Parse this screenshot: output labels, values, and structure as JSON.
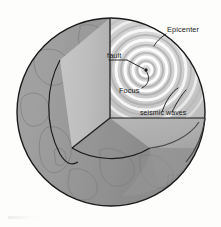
{
  "figure": {
    "type": "cutaway-sphere-diagram",
    "background_color": "#fdfdfc"
  },
  "labels": {
    "epicenter": "Epicenter",
    "fault": "fault",
    "focus": "Focus",
    "seismic_waves": "seismic waves"
  },
  "colors": {
    "outline": "#1b1b1b",
    "crust_shell": "#9a9a9a",
    "mantle_dark": "#8f8f8f",
    "cut_face_light": "#c9c9c9",
    "cut_face_mid": "#b6b6b6",
    "wave_light": "#f2f2f2",
    "wave_dark": "#b9b9b9",
    "text": "#1b1b1b",
    "continent_line": "#7d7d7d"
  },
  "geometry": {
    "sphere_center_x": 111,
    "sphere_center_y": 112,
    "sphere_radius": 94,
    "wedge_vertex_x": 110,
    "wedge_vertex_y": 118,
    "focus_x": 146,
    "focus_y": 70,
    "wave_ring_count": 9
  }
}
